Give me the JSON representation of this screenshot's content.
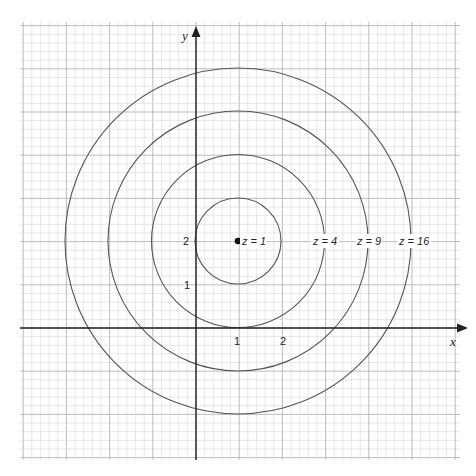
{
  "chart_data": {
    "type": "contour",
    "title": "",
    "xlabel": "x",
    "ylabel": "y",
    "center": [
      1,
      2
    ],
    "x_ticks": [
      {
        "value": 1,
        "label": "1"
      },
      {
        "value": 2,
        "label": "2"
      }
    ],
    "y_ticks": [
      {
        "value": 1,
        "label": "1"
      },
      {
        "value": 2,
        "label": "2"
      }
    ],
    "xlim": [
      -4,
      5.5
    ],
    "ylim": [
      -3,
      7
    ],
    "grid": true,
    "grid_minor_step": 0.2,
    "series": [
      {
        "name": "z = 1",
        "level": 1,
        "radius": 1
      },
      {
        "name": "z = 4",
        "level": 4,
        "radius": 2
      },
      {
        "name": "z = 9",
        "level": 9,
        "radius": 3
      },
      {
        "name": "z = 16",
        "level": 16,
        "radius": 4
      }
    ],
    "annotations": [
      "z = 1",
      "z = 4",
      "z = 9",
      "z = 16"
    ],
    "colors": {
      "curve": "#555555",
      "axis": "#222222",
      "grid": "#cfcfcf"
    }
  },
  "labels": {
    "x_axis": "x",
    "y_axis": "y",
    "tick_x1": "1",
    "tick_x2": "2",
    "tick_y1": "1",
    "tick_y2": "2",
    "z1": "z = 1",
    "z4": "z = 4",
    "z9": "z = 9",
    "z16": "z = 16"
  }
}
